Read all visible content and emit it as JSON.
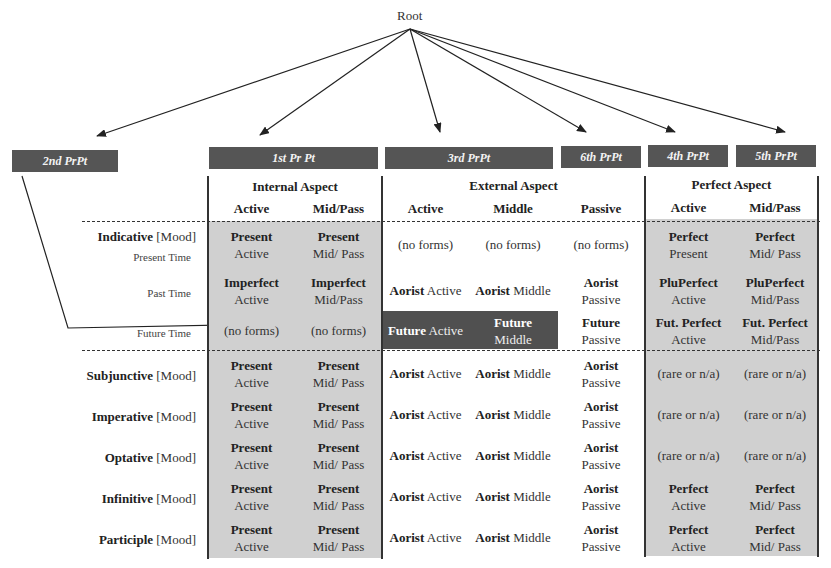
{
  "root": {
    "label": "Root"
  },
  "principal_parts": [
    {
      "id": "2nd",
      "label": "2nd PrPt"
    },
    {
      "id": "1st",
      "label": "1st Pr Pt"
    },
    {
      "id": "3rd",
      "label": "3rd PrPt"
    },
    {
      "id": "6th",
      "label": "6th PrPt"
    },
    {
      "id": "4th",
      "label": "4th PrPt"
    },
    {
      "id": "5th",
      "label": "5th PrPt"
    }
  ],
  "aspects": {
    "internal": "Internal Aspect",
    "external": "External Aspect",
    "perfect": "Perfect Aspect"
  },
  "voices": {
    "internal": [
      "Active",
      "Mid/Pass"
    ],
    "external": [
      "Active",
      "Middle",
      "Passive"
    ],
    "perfect": [
      "Active",
      "Mid/Pass"
    ]
  },
  "mood_suffix": "[Mood]",
  "rows": [
    {
      "mood": "Indicative",
      "time": "Present Time",
      "cells": [
        [
          "Present",
          "Active"
        ],
        [
          "Present",
          "Mid/ Pass"
        ],
        [
          "",
          "(no forms)"
        ],
        [
          "",
          "(no forms)"
        ],
        [
          "",
          "(no forms)"
        ],
        [
          "Perfect",
          "Present"
        ],
        [
          "Perfect",
          "Mid/ Pass"
        ]
      ]
    },
    {
      "mood": "",
      "time": "Past Time",
      "cells": [
        [
          "Imperfect",
          "Active"
        ],
        [
          "Imperfect",
          "Mid/Pass"
        ],
        [
          "Aorist",
          "Active"
        ],
        [
          "Aorist",
          "Middle"
        ],
        [
          "Aorist",
          "Passive"
        ],
        [
          "PluPerfect",
          "Active"
        ],
        [
          "PluPerfect",
          "Mid/Pass"
        ]
      ]
    },
    {
      "mood": "",
      "time": "Future Time",
      "cells": [
        [
          "",
          "(no forms)"
        ],
        [
          "",
          "(no forms)"
        ],
        [
          "Future",
          "Active"
        ],
        [
          "Future",
          "Middle"
        ],
        [
          "Future",
          "Passive"
        ],
        [
          "Fut. Perfect",
          "Active"
        ],
        [
          "Fut. Perfect",
          "Mid/Pass"
        ]
      ]
    },
    {
      "mood": "Subjunctive",
      "time": "",
      "cells": [
        [
          "Present",
          "Active"
        ],
        [
          "Present",
          "Mid/ Pass"
        ],
        [
          "Aorist",
          "Active"
        ],
        [
          "Aorist",
          "Middle"
        ],
        [
          "Aorist",
          "Passive"
        ],
        [
          "",
          "(rare or n/a)"
        ],
        [
          "",
          "(rare or n/a)"
        ]
      ]
    },
    {
      "mood": "Imperative",
      "time": "",
      "cells": [
        [
          "Present",
          "Active"
        ],
        [
          "Present",
          "Mid/ Pass"
        ],
        [
          "Aorist",
          "Active"
        ],
        [
          "Aorist",
          "Middle"
        ],
        [
          "Aorist",
          "Passive"
        ],
        [
          "",
          "(rare or n/a)"
        ],
        [
          "",
          "(rare or n/a)"
        ]
      ]
    },
    {
      "mood": "Optative",
      "time": "",
      "cells": [
        [
          "Present",
          "Active"
        ],
        [
          "Present",
          "Mid/ Pass"
        ],
        [
          "Aorist",
          "Active"
        ],
        [
          "Aorist",
          "Middle"
        ],
        [
          "Aorist",
          "Passive"
        ],
        [
          "",
          "(rare or n/a)"
        ],
        [
          "",
          "(rare or n/a)"
        ]
      ]
    },
    {
      "mood": "Infinitive",
      "time": "",
      "cells": [
        [
          "Present",
          "Active"
        ],
        [
          "Present",
          "Mid/ Pass"
        ],
        [
          "Aorist",
          "Active"
        ],
        [
          "Aorist",
          "Middle"
        ],
        [
          "Aorist",
          "Passive"
        ],
        [
          "Perfect",
          "Active"
        ],
        [
          "Perfect",
          "Mid/ Pass"
        ]
      ]
    },
    {
      "mood": "Participle",
      "time": "",
      "cells": [
        [
          "Present",
          "Active"
        ],
        [
          "Present",
          "Mid/ Pass"
        ],
        [
          "Aorist",
          "Active"
        ],
        [
          "Aorist",
          "Middle"
        ],
        [
          "Aorist",
          "Passive"
        ],
        [
          "Perfect",
          "Active"
        ],
        [
          "Perfect",
          "Mid/ Pass"
        ]
      ]
    }
  ],
  "colors": {
    "box": "#555555",
    "shade": "#d0d0d0",
    "highlight": "#505050"
  }
}
